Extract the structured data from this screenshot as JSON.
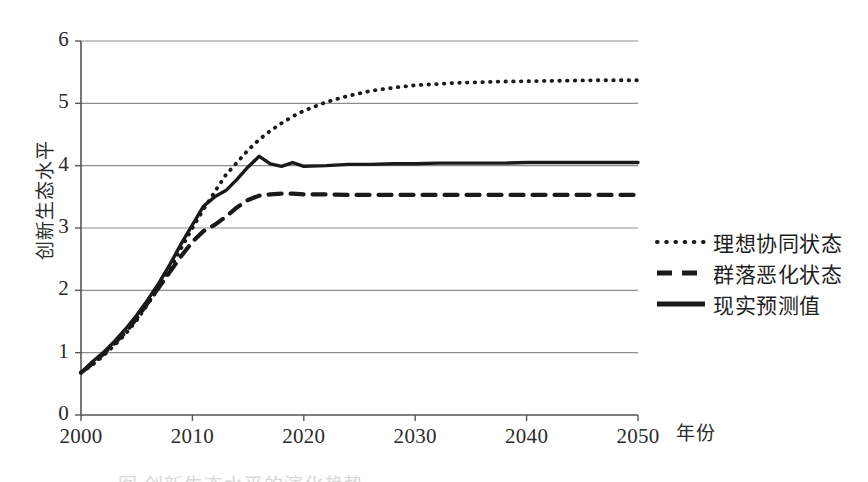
{
  "chart_data": {
    "type": "line",
    "title": "",
    "xlabel": "年份",
    "ylabel": "创新生态水平",
    "xlim": [
      2000,
      2050
    ],
    "ylim": [
      0,
      6
    ],
    "grid": true,
    "grid_axis": "y",
    "legend_position": "right",
    "x_ticks": [
      "2000",
      "2010",
      "2020",
      "2030",
      "2040",
      "2050"
    ],
    "x_tick_values": [
      2000,
      2010,
      2020,
      2030,
      2040,
      2050
    ],
    "y_ticks": [
      "0",
      "1",
      "2",
      "3",
      "4",
      "5",
      "6"
    ],
    "y_tick_values": [
      0,
      1,
      2,
      3,
      4,
      5,
      6
    ],
    "x": [
      2000,
      2001,
      2002,
      2003,
      2004,
      2005,
      2006,
      2007,
      2008,
      2009,
      2010,
      2011,
      2012,
      2013,
      2014,
      2015,
      2016,
      2017,
      2018,
      2019,
      2020,
      2022,
      2024,
      2026,
      2028,
      2030,
      2032,
      2034,
      2036,
      2038,
      2040,
      2042,
      2044,
      2046,
      2048,
      2050
    ],
    "series": [
      {
        "name": "理想协同状态",
        "style": "dotted",
        "color": "#1a1a1a",
        "values": [
          0.68,
          0.8,
          0.95,
          1.12,
          1.3,
          1.52,
          1.78,
          2.05,
          2.35,
          2.68,
          3.0,
          3.3,
          3.58,
          3.85,
          4.05,
          4.25,
          4.42,
          4.56,
          4.68,
          4.79,
          4.88,
          5.02,
          5.12,
          5.2,
          5.25,
          5.29,
          5.31,
          5.33,
          5.34,
          5.35,
          5.355,
          5.36,
          5.365,
          5.37,
          5.37,
          5.37
        ]
      },
      {
        "name": "群落恶化状态",
        "style": "dashed",
        "color": "#1a1a1a",
        "values": [
          0.68,
          0.82,
          0.98,
          1.15,
          1.33,
          1.55,
          1.8,
          2.05,
          2.3,
          2.55,
          2.78,
          2.95,
          3.05,
          3.18,
          3.33,
          3.45,
          3.52,
          3.54,
          3.55,
          3.55,
          3.54,
          3.54,
          3.53,
          3.53,
          3.53,
          3.53,
          3.53,
          3.53,
          3.53,
          3.53,
          3.53,
          3.53,
          3.53,
          3.53,
          3.53,
          3.53
        ]
      },
      {
        "name": "现实预测值",
        "style": "solid",
        "color": "#1a1a1a",
        "values": [
          0.68,
          0.85,
          1.0,
          1.18,
          1.38,
          1.6,
          1.85,
          2.12,
          2.42,
          2.75,
          3.05,
          3.35,
          3.5,
          3.6,
          3.78,
          3.98,
          4.15,
          4.03,
          3.99,
          4.05,
          3.99,
          4.0,
          4.02,
          4.02,
          4.03,
          4.03,
          4.04,
          4.04,
          4.04,
          4.04,
          4.05,
          4.05,
          4.05,
          4.05,
          4.05,
          4.05
        ]
      }
    ]
  },
  "axes": {
    "y_title": "创新生态水平",
    "x_title": "年份"
  },
  "legend": {
    "items": [
      {
        "label": "理想协同状态",
        "marker": "dotted-line-marker"
      },
      {
        "label": "群落恶化状态",
        "marker": "dashed-line-marker"
      },
      {
        "label": "现实预测值",
        "marker": "solid-line-marker"
      }
    ]
  },
  "caption": {
    "text": "图 创新生态水平的演化趋势"
  }
}
